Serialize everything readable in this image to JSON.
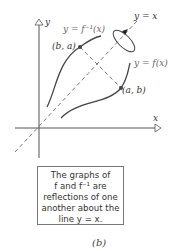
{
  "figure": {
    "axes": {
      "x_label": "x",
      "y_label": "y"
    },
    "curves": [
      {
        "name": "inverse-function",
        "label": "y = f⁻¹(x)"
      },
      {
        "name": "function",
        "label": "y = f(x)"
      },
      {
        "name": "identity-line",
        "label": "y = x"
      }
    ],
    "points": [
      {
        "name": "point-b-a",
        "label": "(b, a)"
      },
      {
        "name": "point-a-b",
        "label": "(a, b)"
      }
    ],
    "caption_lines": [
      "The graphs of",
      "f and f⁻¹ are",
      "reflections of one",
      "another about the",
      "line y = x."
    ],
    "sub_label": "(b)",
    "colors": {
      "stroke": "#444444",
      "dash": "#555555",
      "text": "#333333"
    }
  }
}
